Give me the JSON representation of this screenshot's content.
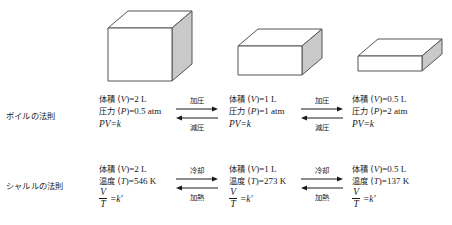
{
  "figure": {
    "background_color": "#ffffff",
    "text_color": "#1a1a1a",
    "box_face_color": "#ffffff",
    "box_side_color": "#c9c9c9",
    "box_stroke_color": "#555555"
  },
  "boxes": [
    {
      "name": "box-large",
      "volume_label": "2 L"
    },
    {
      "name": "box-medium",
      "volume_label": "1 L"
    },
    {
      "name": "box-small",
      "volume_label": "0.5 L"
    }
  ],
  "laws": [
    {
      "label": "ボイルの法則",
      "states": [
        {
          "line1_prefix": "体積 (",
          "line1_var": "V",
          "line1_suffix": ")=2 L",
          "line2_prefix": "圧力 (",
          "line2_var": "P",
          "line2_suffix": ")=0.5 atm",
          "equation": "PV=k"
        },
        {
          "line1_prefix": "体積 (",
          "line1_var": "V",
          "line1_suffix": ")=1 L",
          "line2_prefix": "圧力 (",
          "line2_var": "P",
          "line2_suffix": ")=1 atm",
          "equation": "PV=k"
        },
        {
          "line1_prefix": "体積 (",
          "line1_var": "V",
          "line1_suffix": ")=0.5 L",
          "line2_prefix": "圧力 (",
          "line2_var": "P",
          "line2_suffix": ")=2 atm",
          "equation": "PV=k"
        }
      ],
      "arrows": [
        {
          "forward_label": "加圧",
          "reverse_label": "減圧"
        },
        {
          "forward_label": "加圧",
          "reverse_label": "減圧"
        }
      ]
    },
    {
      "label": "シャルルの法則",
      "states": [
        {
          "line1_prefix": "体積 (",
          "line1_var": "V",
          "line1_suffix": ")=2 L",
          "line2_prefix": "温度 (",
          "line2_var": "T",
          "line2_suffix": ")=546 K",
          "frac_num": "V",
          "frac_den": "T",
          "frac_eq": "=k'"
        },
        {
          "line1_prefix": "体積 (",
          "line1_var": "V",
          "line1_suffix": ")=1 L",
          "line2_prefix": "温度 (",
          "line2_var": "T",
          "line2_suffix": ")=273 K",
          "frac_num": "V",
          "frac_den": "T",
          "frac_eq": "=k'"
        },
        {
          "line1_prefix": "体積 (",
          "line1_var": "V",
          "line1_suffix": ")=0.5 L",
          "line2_prefix": "温度 (",
          "line2_var": "T",
          "line2_suffix": ")=137 K",
          "frac_num": "V",
          "frac_den": "T",
          "frac_eq": "=k'"
        }
      ],
      "arrows": [
        {
          "forward_label": "冷却",
          "reverse_label": "加熱"
        },
        {
          "forward_label": "冷却",
          "reverse_label": "加熱"
        }
      ]
    }
  ]
}
